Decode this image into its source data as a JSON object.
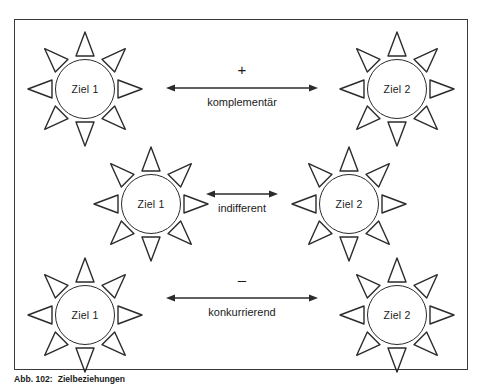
{
  "figure": {
    "caption_number": "Abb. 102:",
    "caption_text": "Zielbeziehungen",
    "border_color": "#3a3a3a",
    "ink_color": "#2b2b2b",
    "background": "#ffffff"
  },
  "nodes": [
    {
      "id": "top-left",
      "label": "Ziel 1",
      "x": 26,
      "y": 30,
      "rays": 8
    },
    {
      "id": "top-right",
      "label": "Ziel 2",
      "x": 338,
      "y": 30,
      "rays": 8
    },
    {
      "id": "middle-left",
      "label": "Ziel 1",
      "x": 92,
      "y": 145,
      "rays": 8
    },
    {
      "id": "middle-right",
      "label": "Ziel 2",
      "x": 290,
      "y": 145,
      "rays": 8
    },
    {
      "id": "bottom-left",
      "label": "Ziel 1",
      "x": 26,
      "y": 256,
      "rays": 8
    },
    {
      "id": "bottom-right",
      "label": "Ziel 2",
      "x": 338,
      "y": 256,
      "rays": 8
    }
  ],
  "relations": [
    {
      "id": "complementary",
      "sign": "+",
      "label": "komplementär",
      "x": 166,
      "y": 62,
      "width": 152,
      "arrow": "double-headed"
    },
    {
      "id": "indifferent",
      "sign": "",
      "label": "indifferent",
      "x": 206,
      "y": 178,
      "width": 72,
      "arrow": "double-headed"
    },
    {
      "id": "competing",
      "sign": "–",
      "label": "konkurrierend",
      "x": 166,
      "y": 272,
      "width": 152,
      "arrow": "double-headed"
    }
  ]
}
